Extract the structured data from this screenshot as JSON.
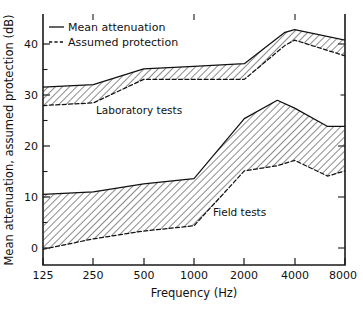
{
  "chart_data": {
    "type": "line",
    "title": "",
    "subtitle": "",
    "xlabel": "Frequency (Hz)",
    "ylabel": "Mean attenuation, assumed protection (dB)",
    "x_scale": "log",
    "x": [
      125,
      250,
      500,
      1000,
      2000,
      4000,
      8000
    ],
    "xtick_labels": [
      "125",
      "250",
      "500",
      "1000",
      "2000",
      "4000",
      "8000"
    ],
    "xlim": [
      125,
      8000
    ],
    "ylim": [
      -4,
      44
    ],
    "ytick_labels": [
      "0",
      "10",
      "20",
      "30",
      "40"
    ],
    "yticks": [
      0,
      10,
      20,
      30,
      40
    ],
    "y_minor_ticks": [
      5,
      15,
      25,
      35
    ],
    "grid": false,
    "legend_position": "top-left",
    "legend": [
      {
        "label": "Mean attenuation",
        "style": "solid"
      },
      {
        "label": "Assumed protection",
        "style": "dashed"
      }
    ],
    "annotations": [
      {
        "text": "Laboratory tests",
        "x": 700,
        "y": 28
      },
      {
        "text": "Field tests",
        "x": 2600,
        "y": 7
      }
    ],
    "series": [
      {
        "name": "Laboratory tests - Mean attenuation",
        "group": "Laboratory tests",
        "style": "solid",
        "x": [
          125,
          250,
          500,
          1000,
          2000,
          3500,
          4000,
          8000
        ],
        "values": [
          30.0,
          30.5,
          33.5,
          34.0,
          34.5,
          40.5,
          41.0,
          39.0
        ]
      },
      {
        "name": "Laboratory tests - Assumed protection",
        "group": "Laboratory tests",
        "style": "dashed",
        "x": [
          125,
          250,
          500,
          1000,
          2000,
          3500,
          4000,
          8000
        ],
        "values": [
          26.5,
          27.0,
          31.5,
          31.5,
          31.5,
          38.0,
          39.0,
          36.0
        ]
      },
      {
        "name": "Field tests - Mean attenuation",
        "group": "Field tests",
        "style": "solid",
        "x": [
          125,
          250,
          500,
          1000,
          2000,
          3150,
          4000,
          6300,
          8000
        ],
        "values": [
          9.5,
          10.0,
          11.5,
          12.5,
          24.0,
          27.5,
          26.0,
          22.5,
          22.5
        ]
      },
      {
        "name": "Field tests - Assumed protection",
        "group": "Field tests",
        "style": "dashed",
        "x": [
          125,
          250,
          500,
          1000,
          2000,
          3150,
          4000,
          6300,
          8000
        ],
        "values": [
          -1.0,
          1.0,
          2.5,
          3.5,
          14.0,
          15.0,
          16.0,
          13.0,
          14.0
        ]
      }
    ],
    "bands": [
      {
        "name": "Laboratory tests",
        "upper": "Laboratory tests - Mean attenuation",
        "lower": "Laboratory tests - Assumed protection",
        "hatch": "diagonal"
      },
      {
        "name": "Field tests",
        "upper": "Field tests - Mean attenuation",
        "lower": "Field tests - Assumed protection",
        "hatch": "diagonal"
      }
    ],
    "colors": {
      "line": "#111111",
      "axis": "#1a1a1a",
      "background": "#ffffff",
      "hatch": "#333333"
    }
  },
  "axes": {
    "x_title": "Frequency (Hz)",
    "y_title": "Mean attenuation, assumed protection (dB)",
    "x_ticks": [
      "125",
      "250",
      "500",
      "1000",
      "2000",
      "4000",
      "8000"
    ],
    "y_ticks": [
      "40",
      "30",
      "20",
      "10",
      "0"
    ]
  },
  "legend": {
    "mean_label": "Mean attenuation",
    "assumed_label": "Assumed protection"
  },
  "labels": {
    "laboratory": "Laboratory tests",
    "field": "Field tests"
  }
}
